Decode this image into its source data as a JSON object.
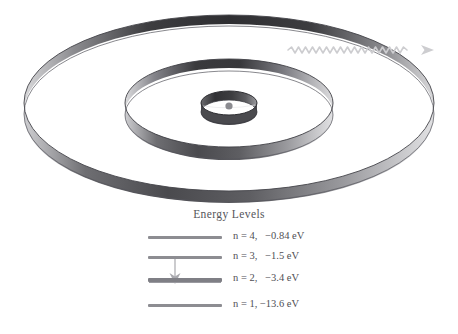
{
  "figure": {
    "name": "bohr-model-energy-level-diagram",
    "background_color": "#ffffff",
    "ink_color": "#4a4a4a"
  },
  "atom": {
    "nucleus_label": "nucleus",
    "photon_label": "emitted-photon",
    "orbits": [
      {
        "n": 1,
        "name": "orbit-n1",
        "rx": 28,
        "ry": 12,
        "band_height": 13
      },
      {
        "n": 2,
        "name": "orbit-n2",
        "rx": 104,
        "ry": 44,
        "band_height": 24
      },
      {
        "n": 3,
        "name": "orbit-n3",
        "rx": 205,
        "ry": 88,
        "band_height": 30
      }
    ],
    "orbit_colors": {
      "band_dark": "#3a3a3c",
      "band_mid": "#6f6f73",
      "band_light": "#d8d8da",
      "outline": "#4e4e52",
      "nucleus_fill": "#8b8b90"
    },
    "photon": {
      "color": "#cfcfd2",
      "wave_cycles": 26,
      "amplitude": 3
    }
  },
  "energy_levels": {
    "title": "Energy Levels",
    "bar_color": "#8d8d92",
    "transition": {
      "name": "transition-n3-to-n2",
      "from_level": 3,
      "to_level": 2,
      "color": "#a9a9ae"
    },
    "levels": [
      {
        "n": 4,
        "label": "n = 4,   −0.84 eV",
        "n_text": "n",
        "eq_text": " = 4,",
        "energy_text": "  −0.84  eV",
        "energy_ev": -0.84,
        "name": "level-n4"
      },
      {
        "n": 3,
        "label": "n = 3,   −1.5 eV",
        "n_text": "n",
        "eq_text": " = 3,",
        "energy_text": "  −1.5  eV",
        "energy_ev": -1.5,
        "name": "level-n3"
      },
      {
        "n": 2,
        "label": "n = 2,   −3.4 eV",
        "n_text": "n",
        "eq_text": " = 2,",
        "energy_text": "  −3.4  eV",
        "energy_ev": -3.4,
        "name": "level-n2"
      },
      {
        "n": 1,
        "label": "n = 1, −13.6 eV",
        "n_text": "n",
        "eq_text": " = 1,",
        "energy_text": " −13.6  eV",
        "energy_ev": -13.6,
        "name": "level-n1"
      }
    ]
  }
}
